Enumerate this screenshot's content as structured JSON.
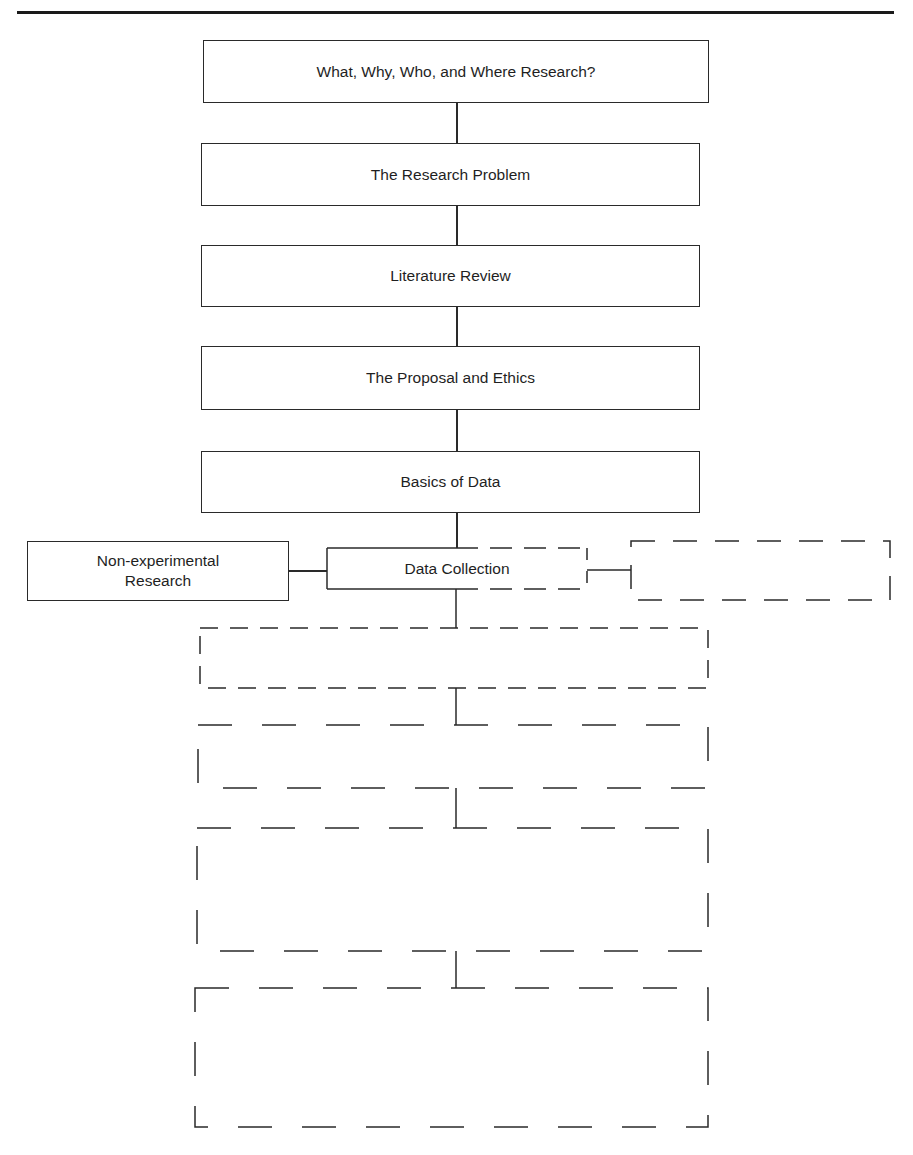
{
  "diagram": {
    "type": "flowchart",
    "steps": [
      {
        "label": "What, Why, Who, and Where Research?",
        "style": "solid"
      },
      {
        "label": "The Research Problem",
        "style": "solid"
      },
      {
        "label": "Literature Review",
        "style": "solid"
      },
      {
        "label": "The Proposal and Ethics",
        "style": "solid"
      },
      {
        "label": "Basics of Data",
        "style": "solid"
      },
      {
        "label": "Data Collection",
        "style": "partial-dashed"
      },
      {
        "label": "",
        "style": "dashed"
      },
      {
        "label": "",
        "style": "dashed"
      },
      {
        "label": "",
        "style": "dashed"
      },
      {
        "label": "",
        "style": "dashed"
      }
    ],
    "branches": {
      "left": {
        "label": "Non-experimental\nResearch",
        "line1": "Non-experimental",
        "line2": "Research",
        "style": "solid"
      },
      "right": {
        "label": "",
        "style": "dashed"
      }
    },
    "colors": {
      "line": "#2a2a2a",
      "background": "#ffffff"
    }
  }
}
